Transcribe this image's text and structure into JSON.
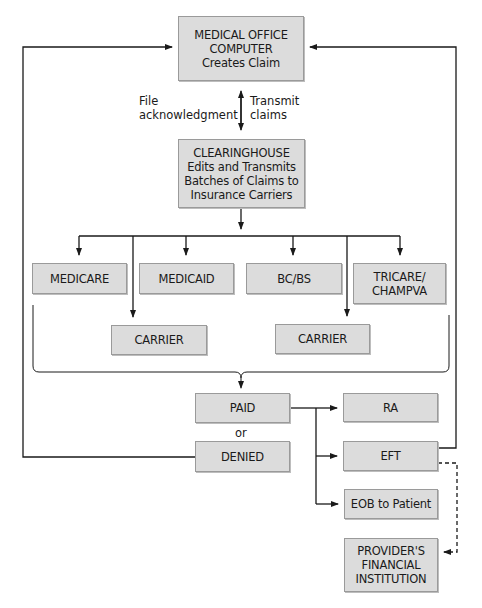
{
  "diagram": {
    "nodes": {
      "medical_office": "MEDICAL OFFICE\nCOMPUTER\nCreates Claim",
      "clearinghouse": "CLEARINGHOUSE\nEdits and Transmits\nBatches of Claims to\nInsurance Carriers",
      "medicare": "MEDICARE",
      "medicaid": "MEDICAID",
      "bcbs": "BC/BS",
      "tricare": "TRICARE/\nCHAMPVA",
      "carrier_1": "CARRIER",
      "carrier_2": "CARRIER",
      "paid": "PAID",
      "denied": "DENIED",
      "ra": "RA",
      "eft": "EFT",
      "eob": "EOB to Patient",
      "provider_bank": "PROVIDER'S\nFINANCIAL\nINSTITUTION"
    },
    "labels": {
      "file_ack": "File\nacknowledgment",
      "transmit": "Transmit\nclaims",
      "or": "or"
    },
    "edges": [
      {
        "from": "medical_office",
        "to": "clearinghouse",
        "label": "Transmit claims",
        "style": "solid"
      },
      {
        "from": "clearinghouse",
        "to": "medical_office",
        "label": "File acknowledgment",
        "style": "solid"
      },
      {
        "from": "clearinghouse",
        "to": "medicare",
        "style": "solid"
      },
      {
        "from": "clearinghouse",
        "to": "medicaid",
        "style": "solid"
      },
      {
        "from": "clearinghouse",
        "to": "bcbs",
        "style": "solid"
      },
      {
        "from": "clearinghouse",
        "to": "tricare",
        "style": "solid"
      },
      {
        "from": "clearinghouse",
        "to": "carrier_1",
        "style": "solid"
      },
      {
        "from": "clearinghouse",
        "to": "carrier_2",
        "style": "solid"
      },
      {
        "from": "payers_group",
        "to": "paid",
        "style": "solid"
      },
      {
        "from": "paid",
        "to": "ra",
        "style": "solid"
      },
      {
        "from": "paid",
        "to": "eft",
        "style": "solid"
      },
      {
        "from": "paid",
        "to": "eob",
        "style": "solid"
      },
      {
        "from": "denied",
        "to": "medical_office",
        "style": "solid"
      },
      {
        "from": "eft",
        "to": "medical_office",
        "style": "solid"
      },
      {
        "from": "eft",
        "to": "provider_bank",
        "style": "dashed"
      }
    ],
    "colors": {
      "box_fill": "#dcdcdc",
      "box_border": "#9a9a9a",
      "line": "#1a1a1a",
      "background": "#ffffff"
    }
  }
}
